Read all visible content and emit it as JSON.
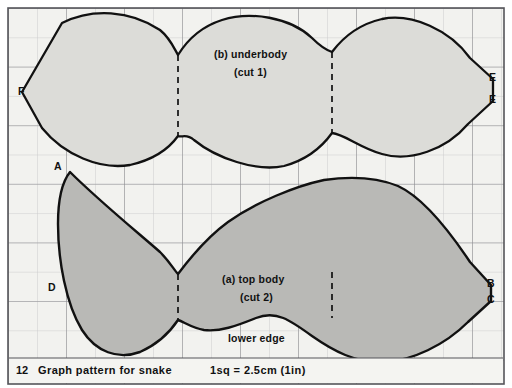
{
  "figure": {
    "number": "12",
    "caption": "Graph pattern for snake",
    "scale_note": "1sq = 2.5cm (1in)",
    "grid": {
      "square_size_px": 29,
      "cols": 17,
      "rows": 13,
      "line_color": "#8e8e94",
      "minor_line_color": "#c9c9cc",
      "paper_color": "#f2f2ef",
      "border_color": "#5a5a5e"
    },
    "ink_color": "#111111"
  },
  "parts": [
    {
      "id": "underbody",
      "label_line1": "(b) underbody",
      "label_line2": "(cut 1)",
      "fill": "#dcdcd8",
      "stroke": "#111111",
      "points": [
        "F",
        "E",
        "E"
      ]
    },
    {
      "id": "top-body",
      "label_line1": "(a) top body",
      "label_line2": "(cut 2)",
      "edge_label": "lower edge",
      "fill": "#b9b9b6",
      "stroke": "#111111",
      "points": [
        "A",
        "D",
        "B",
        "C"
      ]
    }
  ],
  "markers": [
    {
      "name": "F",
      "part": "underbody",
      "x": 22,
      "y": 92
    },
    {
      "name": "E",
      "part": "underbody",
      "x": 493,
      "y": 79
    },
    {
      "name": "E",
      "part": "underbody",
      "x": 493,
      "y": 101
    },
    {
      "name": "A",
      "part": "top-body",
      "x": 58,
      "y": 168
    },
    {
      "name": "D",
      "part": "top-body",
      "x": 52,
      "y": 289
    },
    {
      "name": "B",
      "part": "top-body",
      "x": 491,
      "y": 285
    },
    {
      "name": "C",
      "part": "top-body",
      "x": 491,
      "y": 301
    }
  ],
  "fold_lines": [
    {
      "part": "underbody",
      "x": 178,
      "y1": 55,
      "y2": 136
    },
    {
      "part": "underbody",
      "x": 332,
      "y1": 52,
      "y2": 133
    },
    {
      "part": "top-body",
      "x": 178,
      "y1": 274,
      "y2": 320
    },
    {
      "part": "top-body",
      "x": 332,
      "y1": 272,
      "y2": 318
    }
  ],
  "text_labels": {
    "underbody_title": {
      "text": "(b) underbody",
      "x": 256,
      "y": 56
    },
    "underbody_sub": {
      "text": "(cut 1)",
      "x": 256,
      "y": 73
    },
    "topbody_title": {
      "text": "(a) top body",
      "x": 266,
      "y": 281
    },
    "topbody_sub": {
      "text": "(cut 2)",
      "x": 266,
      "y": 298
    },
    "lower_edge": {
      "text": "lower edge",
      "x": 265,
      "y": 340
    }
  }
}
